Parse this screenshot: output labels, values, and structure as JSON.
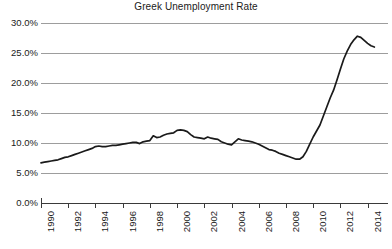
{
  "chart_data": {
    "type": "line",
    "title": "Greek Unemployment Rate",
    "xlabel": "",
    "ylabel": "",
    "grid": true,
    "legend": "none",
    "line_color": "#1a1a1a",
    "grid_color": "#9d9d9d",
    "axis_color": "#3a3a3a",
    "xlim": [
      1990,
      2015.5
    ],
    "ylim": [
      0,
      30
    ],
    "ytick_values": [
      0,
      5,
      10,
      15,
      20,
      25,
      30
    ],
    "ytick_labels": [
      "0.0%",
      "5.0%",
      "10.0%",
      "15.0%",
      "20.0%",
      "25.0%",
      "30.0%"
    ],
    "xtick_values": [
      1990,
      1992,
      1994,
      1996,
      1998,
      2000,
      2002,
      2004,
      2006,
      2008,
      2010,
      2012,
      2014
    ],
    "xtick_labels": [
      "1990",
      "1992",
      "1994",
      "1996",
      "1998",
      "2000",
      "2002",
      "2004",
      "2006",
      "2008",
      "2010",
      "2012",
      "2014"
    ],
    "x": [
      1990.0,
      1990.25,
      1990.5,
      1990.75,
      1991.0,
      1991.25,
      1991.5,
      1991.75,
      1992.0,
      1992.25,
      1992.5,
      1992.75,
      1993.0,
      1993.25,
      1993.5,
      1993.75,
      1994.0,
      1994.25,
      1994.5,
      1994.75,
      1995.0,
      1995.25,
      1995.5,
      1995.75,
      1996.0,
      1996.25,
      1996.5,
      1996.75,
      1997.0,
      1997.25,
      1997.5,
      1997.75,
      1998.0,
      1998.25,
      1998.5,
      1998.75,
      1999.0,
      1999.25,
      1999.5,
      1999.75,
      2000.0,
      2000.25,
      2000.5,
      2000.75,
      2001.0,
      2001.25,
      2001.5,
      2001.75,
      2002.0,
      2002.25,
      2002.5,
      2002.75,
      2003.0,
      2003.25,
      2003.5,
      2003.75,
      2004.0,
      2004.25,
      2004.5,
      2004.75,
      2005.0,
      2005.25,
      2005.5,
      2005.75,
      2006.0,
      2006.25,
      2006.5,
      2006.75,
      2007.0,
      2007.25,
      2007.5,
      2007.75,
      2008.0,
      2008.25,
      2008.5,
      2008.75,
      2009.0,
      2009.25,
      2009.5,
      2009.75,
      2010.0,
      2010.25,
      2010.5,
      2010.75,
      2011.0,
      2011.25,
      2011.5,
      2011.75,
      2012.0,
      2012.25,
      2012.5,
      2012.75,
      2013.0,
      2013.25,
      2013.5,
      2013.75,
      2014.0,
      2014.25,
      2014.5
    ],
    "values": [
      6.7,
      6.8,
      6.9,
      7.0,
      7.1,
      7.2,
      7.4,
      7.6,
      7.7,
      7.9,
      8.1,
      8.3,
      8.5,
      8.7,
      8.9,
      9.1,
      9.4,
      9.5,
      9.4,
      9.4,
      9.5,
      9.6,
      9.6,
      9.7,
      9.8,
      9.9,
      10.0,
      10.1,
      10.1,
      9.9,
      10.2,
      10.3,
      10.4,
      11.2,
      10.9,
      11.0,
      11.3,
      11.5,
      11.6,
      11.7,
      12.1,
      12.2,
      12.1,
      11.9,
      11.4,
      11.0,
      10.9,
      10.8,
      10.7,
      11.0,
      10.8,
      10.7,
      10.6,
      10.2,
      10.0,
      9.8,
      9.7,
      10.2,
      10.7,
      10.5,
      10.4,
      10.3,
      10.2,
      10.0,
      9.8,
      9.5,
      9.2,
      8.9,
      8.8,
      8.6,
      8.3,
      8.1,
      7.9,
      7.7,
      7.5,
      7.3,
      7.3,
      7.7,
      8.6,
      9.8,
      11.0,
      12.0,
      13.0,
      14.5,
      16.0,
      17.5,
      18.8,
      20.5,
      22.3,
      24.0,
      25.3,
      26.4,
      27.2,
      27.8,
      27.6,
      27.1,
      26.6,
      26.2,
      26.0
    ]
  }
}
